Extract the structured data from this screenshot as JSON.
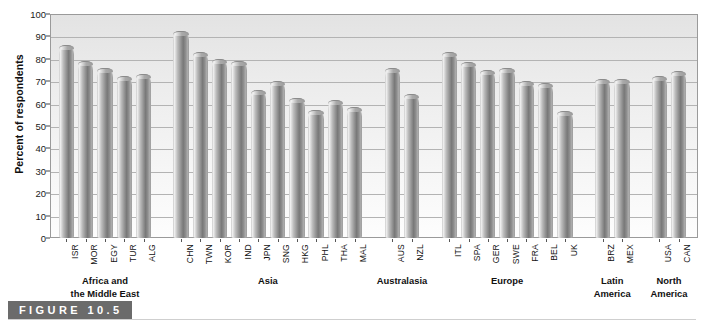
{
  "figure": {
    "caption_label": "FIGURE 10.5"
  },
  "chart_data": {
    "type": "bar",
    "title": "",
    "xlabel": "",
    "ylabel": "Percent of respondents",
    "ylim": [
      0,
      100
    ],
    "ytick_step": 10,
    "yticks": [
      0,
      10,
      20,
      30,
      40,
      50,
      60,
      70,
      80,
      90,
      100
    ],
    "grid": true,
    "legend": "none",
    "bar_color": "#8e8e8e",
    "plot_background": "#ededed",
    "categories": [
      "ISR",
      "MOR",
      "EGY",
      "TUR",
      "ALG",
      "CHN",
      "TWN",
      "KOR",
      "IND",
      "JPN",
      "SNG",
      "HKG",
      "PHL",
      "THA",
      "MAL",
      "AUS",
      "NZL",
      "ITL",
      "SPA",
      "GER",
      "SWE",
      "FRA",
      "BEL",
      "UK",
      "BRZ",
      "MEX",
      "USA",
      "CAN"
    ],
    "values": [
      86,
      79,
      76,
      72.5,
      73,
      92.5,
      83,
      80,
      79,
      66,
      70,
      62.5,
      57,
      61.5,
      58.5,
      76,
      64.5,
      83,
      78.5,
      75,
      76,
      70,
      69,
      56.5,
      71,
      71,
      72.5,
      74.5
    ],
    "groups": [
      {
        "name": "Africa and the Middle East",
        "lines": [
          "Africa and",
          "the Middle East"
        ],
        "start": 0,
        "count": 5
      },
      {
        "name": "Asia",
        "lines": [
          "Asia"
        ],
        "start": 5,
        "count": 10
      },
      {
        "name": "Australasia",
        "lines": [
          "Australasia"
        ],
        "start": 15,
        "count": 2
      },
      {
        "name": "Europe",
        "lines": [
          "Europe"
        ],
        "start": 17,
        "count": 7
      },
      {
        "name": "Latin America",
        "lines": [
          "Latin",
          "America"
        ],
        "start": 24,
        "count": 2
      },
      {
        "name": "North America",
        "lines": [
          "North",
          "America"
        ],
        "start": 26,
        "count": 2
      }
    ]
  }
}
